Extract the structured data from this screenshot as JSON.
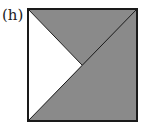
{
  "figure": {
    "label": "(h)",
    "fill_color": "#8a8a8a",
    "stroke_color": "#1a1a1a"
  }
}
